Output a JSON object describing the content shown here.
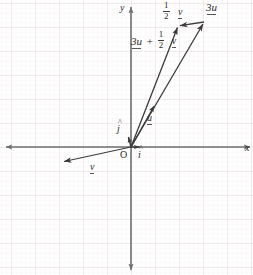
{
  "figure": {
    "type": "vector-diagram",
    "title": "",
    "background_color": "#ffffff",
    "grid": {
      "major_color": "#e3d9da",
      "minor_color": "#f2ecec",
      "major_spacing_px": 24,
      "minor_per_major": 5,
      "visible": true
    },
    "axes": {
      "color": "#6e6e6e",
      "x_label": "x",
      "y_label": "y",
      "origin_label": "O",
      "origin_px": {
        "x": 131,
        "y": 147
      },
      "x_range_px": [
        0,
        253
      ],
      "y_range_px": [
        0,
        275
      ],
      "double_headed": true
    },
    "vector_color": "#3b3b3b",
    "vectors": [
      {
        "name": "i-hat",
        "label": "i",
        "accent": "hat",
        "from_px": {
          "x": 131,
          "y": 147
        },
        "to_px": {
          "x": 143,
          "y": 147
        },
        "label_px": {
          "x": 139,
          "y": 152
        }
      },
      {
        "name": "j-hat",
        "label": "j",
        "accent": "hat",
        "from_px": {
          "x": 131,
          "y": 147
        },
        "to_px": {
          "x": 128,
          "y": 135
        },
        "label_px": {
          "x": 118,
          "y": 126
        }
      },
      {
        "name": "u",
        "label": "u",
        "accent": "under",
        "from_px": {
          "x": 131,
          "y": 147
        },
        "to_px": {
          "x": 155,
          "y": 105
        },
        "label_px": {
          "x": 149,
          "y": 116
        }
      },
      {
        "name": "v",
        "label": "v",
        "accent": "under",
        "from_px": {
          "x": 131,
          "y": 147
        },
        "to_px": {
          "x": 62,
          "y": 162
        },
        "label_px": {
          "x": 92,
          "y": 164
        }
      },
      {
        "name": "3u",
        "label": "3u",
        "accent": "under",
        "from_px": {
          "x": 131,
          "y": 147
        },
        "to_px": {
          "x": 204,
          "y": 22
        },
        "label_px": {
          "x": 208,
          "y": 4
        }
      },
      {
        "name": "half-v",
        "label_numerator": "1",
        "label_denominator": "2",
        "label_vector": "v",
        "accent": "under",
        "from_px": {
          "x": 204,
          "y": 22
        },
        "to_px": {
          "x": 178,
          "y": 26
        },
        "label_px": {
          "x": 165,
          "y": 3
        }
      },
      {
        "name": "3u-plus-half-v",
        "label_prefix": "3u",
        "label_plus": "+",
        "label_numerator": "1",
        "label_denominator": "2",
        "label_vector": "v",
        "accent": "under",
        "from_px": {
          "x": 131,
          "y": 147
        },
        "to_px": {
          "x": 178,
          "y": 26
        },
        "label_px": {
          "x": 133,
          "y": 34
        }
      }
    ]
  }
}
